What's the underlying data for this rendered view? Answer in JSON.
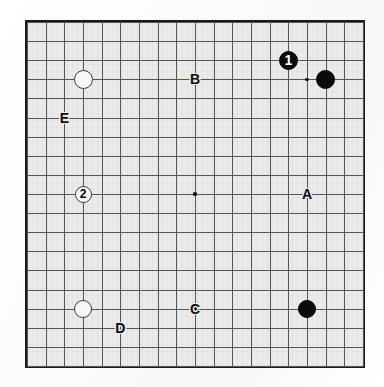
{
  "diagram": {
    "board_size": 19,
    "board": {
      "left": 25,
      "top": 20,
      "width": 340,
      "height": 348,
      "border_color": "#1a1a1a",
      "surface_color": "#ebebeb",
      "line_color": "#555555"
    },
    "colors": {
      "black_stone": "#0b0b0b",
      "white_stone": "#f7f7f7",
      "stone_outline": "#3a3a3a",
      "label_text": "#0b0b0b",
      "page_background": "#fdfdfd"
    },
    "hoshi_points": [
      {
        "name": "hoshi-top-left",
        "col": 3,
        "row": 3
      },
      {
        "name": "hoshi-top-center",
        "col": 9,
        "row": 3
      },
      {
        "name": "hoshi-top-right",
        "col": 15,
        "row": 3
      },
      {
        "name": "hoshi-middle-left",
        "col": 3,
        "row": 9
      },
      {
        "name": "hoshi-tengen",
        "col": 9,
        "row": 9
      },
      {
        "name": "hoshi-middle-right",
        "col": 15,
        "row": 9
      },
      {
        "name": "hoshi-bottom-left",
        "col": 3,
        "row": 15
      },
      {
        "name": "hoshi-bottom-center",
        "col": 9,
        "row": 15
      },
      {
        "name": "hoshi-bottom-right",
        "col": 15,
        "row": 15
      }
    ],
    "stones": [
      {
        "id": "white-stone-top-left",
        "color": "white",
        "col": 3,
        "row": 3,
        "number": "",
        "radius": 9.5
      },
      {
        "id": "move-1-black",
        "color": "black",
        "col": 14,
        "row": 2,
        "number": "1",
        "radius": 9.5
      },
      {
        "id": "black-stone-top-right",
        "color": "black",
        "col": 16,
        "row": 3,
        "number": "",
        "radius": 9.5
      },
      {
        "id": "move-2-white",
        "color": "white",
        "col": 3,
        "row": 9,
        "number": "2",
        "radius": 8.5
      },
      {
        "id": "white-stone-bottom-left",
        "color": "white",
        "col": 3,
        "row": 15,
        "number": "",
        "radius": 9.0
      },
      {
        "id": "black-stone-bottom-right",
        "color": "black",
        "col": 15,
        "row": 15,
        "number": "",
        "radius": 9.0
      }
    ],
    "point_labels": [
      {
        "id": "label-A",
        "text": "A",
        "col": 15,
        "row": 9
      },
      {
        "id": "label-B",
        "text": "B",
        "col": 9,
        "row": 3
      },
      {
        "id": "label-C",
        "text": "C",
        "col": 9,
        "row": 15
      },
      {
        "id": "label-D",
        "text": "D",
        "col": 5,
        "row": 16
      },
      {
        "id": "label-E",
        "text": "E",
        "col": 2,
        "row": 5
      }
    ]
  }
}
